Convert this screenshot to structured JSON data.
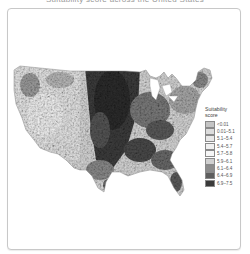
{
  "caption": {
    "text": "Suitability score across the United States"
  },
  "map": {
    "title": "Suitability score map of the contiguous United States",
    "colors": {
      "background": "#ffffff",
      "frame_border": "#c8c8c8",
      "land_light": "#e6e6e6",
      "land_mid": "#b0b0b0",
      "land_dark": "#4a4a4a",
      "land_darkest": "#2e2e2e"
    }
  },
  "legend": {
    "title_line1": "Suitability",
    "title_line2": "score",
    "items": [
      {
        "label": "<0.01",
        "color": "#c4c4c4"
      },
      {
        "label": "0.01–5.1",
        "color": "#dcdcdc"
      },
      {
        "label": "5.1–5.4",
        "color": "#e8e8e8"
      },
      {
        "label": "5.4–5.7",
        "color": "#f0f0f0"
      },
      {
        "label": "5.7–5.8",
        "color": "#f6f6f6"
      },
      {
        "label": "5.9–6.1",
        "color": "#d0d0d0"
      },
      {
        "label": "6.1–6.4",
        "color": "#8c8c8c"
      },
      {
        "label": "6.4–6.9",
        "color": "#5e5e5e"
      },
      {
        "label": "6.9–7.5",
        "color": "#3a3a3a"
      }
    ]
  }
}
